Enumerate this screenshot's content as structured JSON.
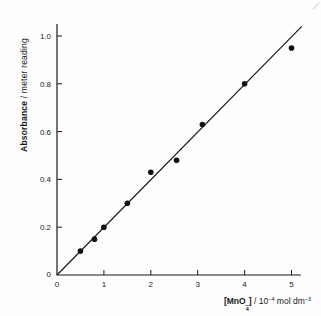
{
  "figure": {
    "y_axis_label": {
      "bold": "Absorbance",
      "rest": " / meter reading"
    },
    "x_axis_label": {
      "formula_prefix": "[MnO",
      "formula_sup": "−",
      "formula_sub": "4",
      "formula_suffix": "]",
      "units_pre": " / 10",
      "units_exp1": "−4",
      "units_mid": " mol dm",
      "units_exp2": "−3"
    }
  },
  "chart_data": {
    "type": "scatter",
    "title": "",
    "xlabel": "[MnO4-] / 10^-4 mol dm^-3",
    "ylabel": "Absorbance / meter reading",
    "x": [
      0.5,
      0.8,
      1.0,
      1.5,
      2.0,
      2.55,
      3.1,
      4.0,
      5.0
    ],
    "y": [
      0.1,
      0.15,
      0.2,
      0.3,
      0.43,
      0.48,
      0.63,
      0.8,
      0.95
    ],
    "fit_line": {
      "x_start": 0,
      "y_start": 0,
      "x_end": 5.22,
      "y_end": 1.04
    },
    "xlim": [
      0,
      5.2
    ],
    "ylim": [
      0,
      1.05
    ],
    "xticks": [
      0,
      1,
      2,
      3,
      4,
      5
    ],
    "xtick_labels": [
      "0",
      "1",
      "2",
      "3",
      "4",
      "5"
    ],
    "yticks": [
      0,
      0.2,
      0.4,
      0.6,
      0.8,
      1.0
    ],
    "ytick_labels": [
      "0",
      "0.2",
      "0.4",
      "0.6",
      "0.8",
      "1.0"
    ],
    "grid": false,
    "legend": null,
    "marker": {
      "shape": "circle",
      "color": "#111111",
      "radius_px": 2.8
    },
    "line_color": "#1a1a1a",
    "axis_color": "#1a1a1a"
  }
}
